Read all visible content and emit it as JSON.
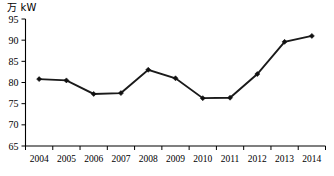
{
  "chart_data": {
    "type": "line",
    "title": "",
    "subtitle": "",
    "xlabel": "",
    "ylabel": "",
    "unit_label": "万 kW",
    "categories": [
      "2004",
      "2005",
      "2006",
      "2007",
      "2008",
      "2009",
      "2010",
      "2011",
      "2012",
      "2013",
      "2014"
    ],
    "values": [
      80.8,
      80.5,
      77.3,
      77.5,
      83.0,
      81.0,
      76.3,
      76.4,
      82.0,
      89.6,
      91.0
    ],
    "series": [
      {
        "name": "",
        "values": [
          80.8,
          80.5,
          77.3,
          77.5,
          83.0,
          81.0,
          76.3,
          76.4,
          82.0,
          89.6,
          91.0
        ]
      }
    ],
    "ylim": [
      65,
      95
    ],
    "yticks": [
      65,
      70,
      75,
      80,
      85,
      90,
      95
    ],
    "ytick_labels": [
      "65",
      "70",
      "75",
      "80",
      "85",
      "90",
      "95"
    ],
    "grid": false,
    "legend": false,
    "legend_position": "none",
    "marker": "diamond",
    "line_color": "#1a1a1a",
    "marker_color": "#111111",
    "axis_color": "#000000",
    "background": "#ffffff"
  }
}
